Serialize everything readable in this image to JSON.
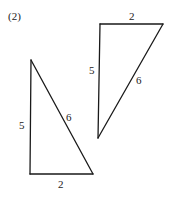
{
  "figure_label": "(2)",
  "triangles": [
    {
      "name": "left-triangle",
      "sides": {
        "vertical": "5",
        "hypotenuse": "6",
        "base": "2"
      }
    },
    {
      "name": "right-triangle",
      "sides": {
        "vertical": "5",
        "hypotenuse": "6",
        "top": "2"
      }
    }
  ]
}
